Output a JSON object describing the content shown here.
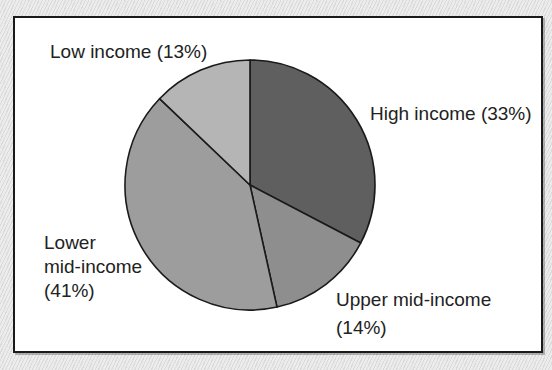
{
  "chart_data": {
    "type": "pie",
    "title": "",
    "start_angle_deg": 0,
    "direction": "clockwise",
    "slices": [
      {
        "label": "High income",
        "value": 33,
        "display": "High income (33%)",
        "color": "#5f5f5f"
      },
      {
        "label": "Upper mid-income",
        "value": 14,
        "display": "Upper mid-income (14%)",
        "color": "#8e8e8e"
      },
      {
        "label": "Lower mid-income",
        "value": 41,
        "display": "Lower mid-income (41%)",
        "color": "#9d9d9d"
      },
      {
        "label": "Low income",
        "value": 13,
        "display": "Low income (13%)",
        "color": "#b5b5b5"
      }
    ],
    "categories": [
      "High income",
      "Upper mid-income",
      "Lower mid-income",
      "Low income"
    ],
    "values": [
      33,
      14,
      41,
      13
    ],
    "legend": "none (direct labels)",
    "grid": false
  },
  "labels": {
    "high": {
      "line1": "High income (33%)"
    },
    "upper_mid": {
      "line1": "Upper mid-income",
      "line2": "(14%)"
    },
    "lower_mid": {
      "line1": "Lower",
      "line2": "mid-income",
      "line3": "(41%)"
    },
    "low": {
      "line1": "Low income (13%)"
    }
  },
  "colors": {
    "background": "#e4e4e4",
    "panel": "#ffffff",
    "border": "#1a1a1a",
    "text": "#222222"
  }
}
